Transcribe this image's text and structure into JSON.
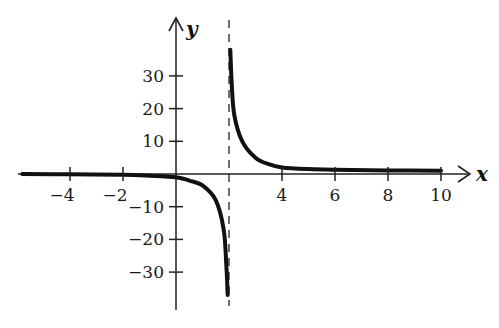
{
  "chart_data": {
    "type": "line",
    "title": "",
    "xlabel": "x",
    "ylabel": "y",
    "xlim": [
      -5.8,
      10.5
    ],
    "ylim": [
      -40,
      40
    ],
    "grid": false,
    "legend": null,
    "x_ticks": [
      -4,
      -2,
      4,
      6,
      8,
      10
    ],
    "x_tick_labels": [
      "−4",
      "−2",
      "4",
      "6",
      "8",
      "10"
    ],
    "y_ticks": [
      30,
      20,
      10,
      -10,
      -20,
      -30
    ],
    "y_tick_labels": [
      "30",
      "20",
      "10",
      "−10",
      "−20",
      "−30"
    ],
    "vertical_asymptote": {
      "x": 2,
      "style": "dashed"
    },
    "series": [
      {
        "name": "left branch",
        "x": [
          -5.8,
          -4,
          -2,
          -1,
          0,
          0.5,
          1,
          1.5,
          1.8,
          1.9,
          1.95
        ],
        "y": [
          0,
          -0.1,
          -0.2,
          -0.5,
          -1,
          -2,
          -3.5,
          -8,
          -17,
          -28,
          -37
        ]
      },
      {
        "name": "right branch",
        "x": [
          2.05,
          2.1,
          2.2,
          2.5,
          3,
          3.5,
          4,
          5,
          6,
          8,
          10
        ],
        "y": [
          38,
          28,
          18,
          10,
          5,
          3,
          2,
          1.5,
          1.3,
          1.1,
          1
        ]
      }
    ]
  },
  "axes": {
    "x_label": "x",
    "y_label": "y"
  }
}
